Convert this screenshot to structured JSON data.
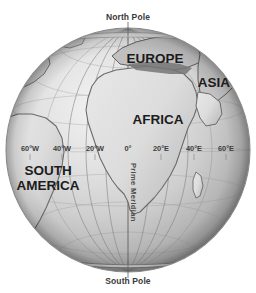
{
  "diagram": {
    "background_color": "#ffffff",
    "globe": {
      "center_x": 128,
      "center_y": 150,
      "radius": 122,
      "ocean_light_color": "#e9e9e9",
      "ocean_mid_color": "#c8c8c8",
      "ocean_dark_color": "#8d8d8d",
      "land_color": "#dedede",
      "land_outline_color": "#6f6f6f",
      "grid_line_color": "#7a7a7a"
    }
  },
  "poles": {
    "north": "North Pole",
    "south": "South Pole"
  },
  "prime_meridian": {
    "label": "Prime Meridian",
    "x": 128
  },
  "longitude_labels": [
    {
      "label": "60°W",
      "x": 30,
      "y": 151
    },
    {
      "label": "40°W",
      "x": 62,
      "y": 151
    },
    {
      "label": "20°W",
      "x": 95,
      "y": 151
    },
    {
      "label": "0°",
      "x": 128,
      "y": 151
    },
    {
      "label": "20°E",
      "x": 161,
      "y": 151
    },
    {
      "label": "40°E",
      "x": 194,
      "y": 151
    },
    {
      "label": "60°E",
      "x": 226,
      "y": 151
    }
  ],
  "continents": [
    {
      "name": "EUROPE",
      "x": 155,
      "y": 63,
      "font_size": 13.5
    },
    {
      "name": "ASIA",
      "x": 214,
      "y": 87,
      "font_size": 13.5
    },
    {
      "name": "AFRICA",
      "x": 158,
      "y": 124,
      "font_size": 13.5
    },
    {
      "name": "SOUTH",
      "x": 48,
      "y": 175,
      "font_size": 13.5
    },
    {
      "name": "AMERICA",
      "x": 48,
      "y": 190,
      "font_size": 13.5
    }
  ]
}
